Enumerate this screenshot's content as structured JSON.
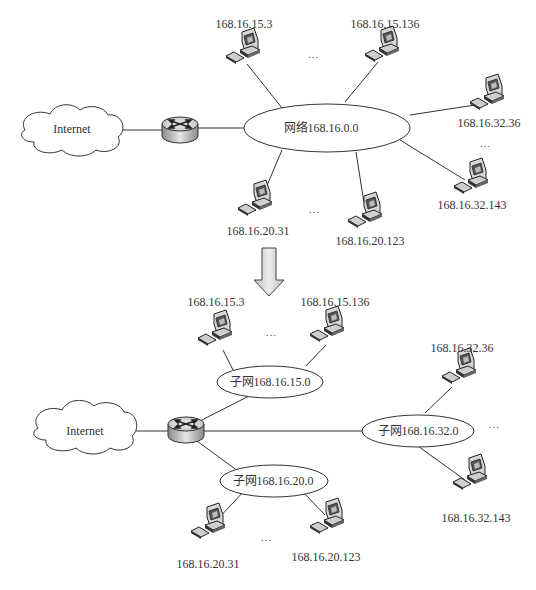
{
  "diagram": {
    "type": "network-subnetting",
    "before": {
      "cloud_label": "Internet",
      "network_label": "网络168.16.0.0",
      "hosts": [
        "168.16.15.3",
        "168.16.15.136",
        "168.16.32.36",
        "168.16.32.143",
        "168.16.20.31",
        "168.16.20.123"
      ],
      "ellipsis": "…"
    },
    "after": {
      "cloud_label": "Internet",
      "subnets": [
        {
          "label": "子网168.16.15.0",
          "hosts": [
            "168.16.15.3",
            "168.16.15.136"
          ]
        },
        {
          "label": "子网168.16.32.0",
          "hosts": [
            "168.16.32.36",
            "168.16.32.143"
          ]
        },
        {
          "label": "子网168.16.20.0",
          "hosts": [
            "168.16.20.31",
            "168.16.20.123"
          ]
        }
      ],
      "ellipsis": "…"
    }
  }
}
